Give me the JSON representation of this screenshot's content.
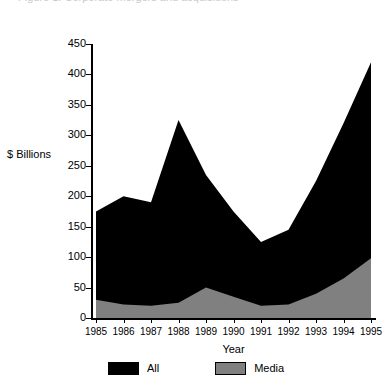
{
  "top_clipped_text": "Figure 1.  Corporate mergers and acquisitions",
  "chart_data": {
    "type": "area",
    "title": "",
    "subtitle": "",
    "xlabel": "Year",
    "ylabel": "$ Billions",
    "categories": [
      "1985",
      "1986",
      "1987",
      "1988",
      "1989",
      "1990",
      "1991",
      "1992",
      "1993",
      "1994",
      "1995"
    ],
    "x_tick_labels": [
      "1985",
      "1986",
      "1987",
      "1988",
      "1989",
      "1990",
      "1991",
      "1992",
      "1993",
      "1994",
      "1995"
    ],
    "y_tick_labels": [
      "0",
      "50",
      "100",
      "150",
      "200",
      "250",
      "300",
      "350",
      "400",
      "450"
    ],
    "y_ticks": [
      0,
      50,
      100,
      150,
      200,
      250,
      300,
      350,
      400,
      450
    ],
    "ylim": [
      0,
      450
    ],
    "grid": false,
    "stacked": false,
    "legend_position": "bottom",
    "series": [
      {
        "name": "All",
        "color": "#000000",
        "values": [
          175,
          200,
          190,
          325,
          235,
          175,
          125,
          145,
          225,
          320,
          420
        ]
      },
      {
        "name": "Media",
        "color": "#808080",
        "values": [
          30,
          22,
          20,
          25,
          50,
          35,
          20,
          22,
          40,
          65,
          98
        ]
      }
    ],
    "legend": [
      {
        "label": "All",
        "color": "#000000"
      },
      {
        "label": "Media",
        "color": "#808080"
      }
    ]
  }
}
